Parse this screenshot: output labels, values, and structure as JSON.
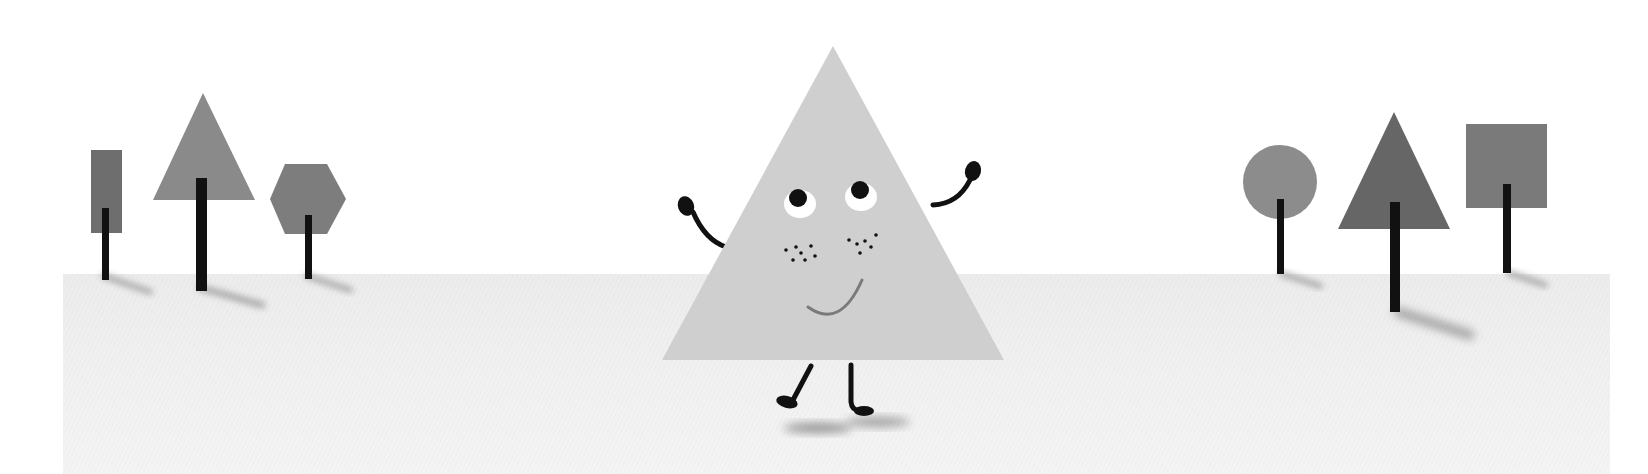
{
  "scene": {
    "description": "Illustration of a smiling triangle character waving on a pale ground, flanked by geometric-shape trees",
    "colors": {
      "background": "#ffffff",
      "ground": "#eeeeee",
      "character_fill": "#cfcfcf",
      "trunk": "#111111",
      "eye_white": "#ffffff",
      "pupil": "#111111",
      "smile": "#7a7a7a"
    },
    "left_trees": [
      {
        "shape": "rectangle",
        "fill": "#6e6e6e"
      },
      {
        "shape": "triangle",
        "fill": "#8a8a8a"
      },
      {
        "shape": "hexagon",
        "fill": "#7d7d7d"
      }
    ],
    "right_trees": [
      {
        "shape": "circle",
        "fill": "#8c8c8c"
      },
      {
        "shape": "triangle",
        "fill": "#666666"
      },
      {
        "shape": "square",
        "fill": "#7a7a7a"
      }
    ],
    "character": {
      "shape": "triangle",
      "expression": "smiling",
      "pose": "waving both arms, walking"
    }
  }
}
